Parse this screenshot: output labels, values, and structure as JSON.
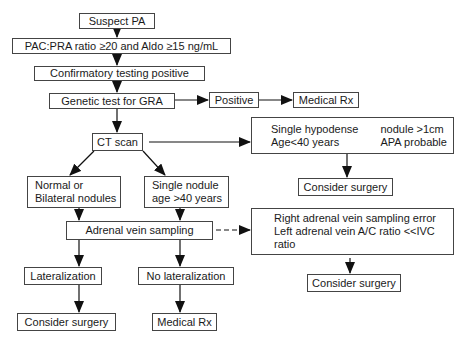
{
  "diagram": {
    "type": "flowchart",
    "nodes": {
      "suspect_pa": "Suspect PA",
      "pac_pra": "PAC:PRA ratio ≥20 and Aldo ≥15 ng/mL",
      "confirmatory": "Confirmatory testing positive",
      "genetic": "Genetic test for GRA",
      "positive": "Positive",
      "medical_rx_top": "Medical Rx",
      "ct_scan": "CT scan",
      "hypodense": {
        "line1_left": "Single hypodense",
        "line1_right": "nodule >1cm",
        "line2_left": "Age<40 years",
        "line2_right": "APA probable"
      },
      "surgery_top": "Consider surgery",
      "normal": {
        "line1": "Normal or",
        "line2": "Bilateral nodules"
      },
      "single_nodule": {
        "line1": "Single nodule",
        "line2": "age >40 years"
      },
      "avs": "Adrenal vein sampling",
      "avs_error": {
        "line1": "Right adrenal vein sampling error",
        "line2": "Left adrenal vein A/C ratio <<IVC",
        "line3": "ratio"
      },
      "surgery_right": "Consider surgery",
      "lateralization": "Lateralization",
      "no_lateralization": "No lateralization",
      "surgery_bottom": "Consider surgery",
      "medical_rx_bottom": "Medical Rx"
    },
    "edges": [
      [
        "suspect_pa",
        "pac_pra",
        "solid"
      ],
      [
        "pac_pra",
        "confirmatory",
        "solid"
      ],
      [
        "confirmatory",
        "genetic",
        "solid"
      ],
      [
        "genetic",
        "positive",
        "solid"
      ],
      [
        "positive",
        "medical_rx_top",
        "solid"
      ],
      [
        "genetic",
        "ct_scan",
        "solid"
      ],
      [
        "ct_scan",
        "hypodense",
        "solid"
      ],
      [
        "hypodense",
        "surgery_top",
        "solid"
      ],
      [
        "ct_scan",
        "normal",
        "solid"
      ],
      [
        "ct_scan",
        "single_nodule",
        "solid"
      ],
      [
        "normal",
        "avs",
        "solid"
      ],
      [
        "single_nodule",
        "avs",
        "solid"
      ],
      [
        "avs",
        "avs_error",
        "dashed"
      ],
      [
        "avs_error",
        "surgery_right",
        "solid"
      ],
      [
        "avs",
        "lateralization",
        "solid"
      ],
      [
        "avs",
        "no_lateralization",
        "solid"
      ],
      [
        "lateralization",
        "surgery_bottom",
        "solid"
      ],
      [
        "no_lateralization",
        "medical_rx_bottom",
        "solid"
      ]
    ]
  }
}
